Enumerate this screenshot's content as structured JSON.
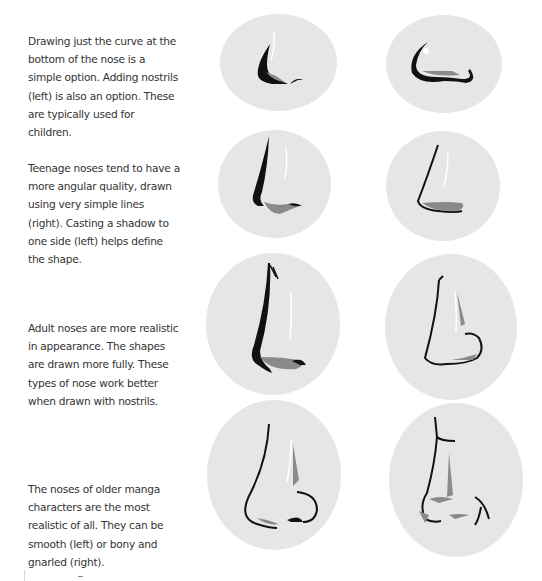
{
  "sections": [
    {
      "id": "children",
      "caption": "Drawing just the curve at the bottom of the nose is a simple option. Adding nostrils (left) is also an option. These are typically used for children.",
      "left_illustration": "child-nose-with-nostrils",
      "right_illustration": "child-nose-simple-curve"
    },
    {
      "id": "teenage",
      "caption": "Teenage noses tend to have a more angular quality, drawn using very simple lines (right). Casting a shadow to one side (left) helps define the shape.",
      "left_illustration": "teen-nose-shadowed",
      "right_illustration": "teen-nose-simple-lines"
    },
    {
      "id": "adult",
      "caption": "Adult noses are more realistic in appearance. The shapes are drawn more fully. These types of nose work better when drawn with nostrils.",
      "left_illustration": "adult-nose-shadowed",
      "right_illustration": "adult-nose-with-nostrils"
    },
    {
      "id": "older",
      "caption": "The noses of older manga characters are the most realistic of all. They can be smooth (left) or bony and gnarled (right).",
      "left_illustration": "older-nose-smooth",
      "right_illustration": "older-nose-bony-gnarled"
    }
  ],
  "colors": {
    "oval_fill": "#e6e6e6",
    "ink": "#111111",
    "shadow": "#8a8a8a",
    "highlight": "#ffffff"
  }
}
